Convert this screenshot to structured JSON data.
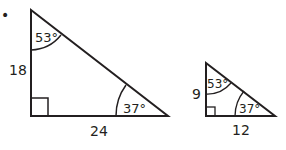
{
  "bullet": "•",
  "large_triangle": {
    "top_angle": "53°",
    "right_angle": "37°",
    "vertical_side": "18",
    "horizontal_side": "24"
  },
  "small_triangle": {
    "top_angle": "53°",
    "right_angle": "37°",
    "vertical_side": "9",
    "horizontal_side": "12"
  },
  "colors": {
    "stroke": "#231f20",
    "background": "#ffffff"
  }
}
